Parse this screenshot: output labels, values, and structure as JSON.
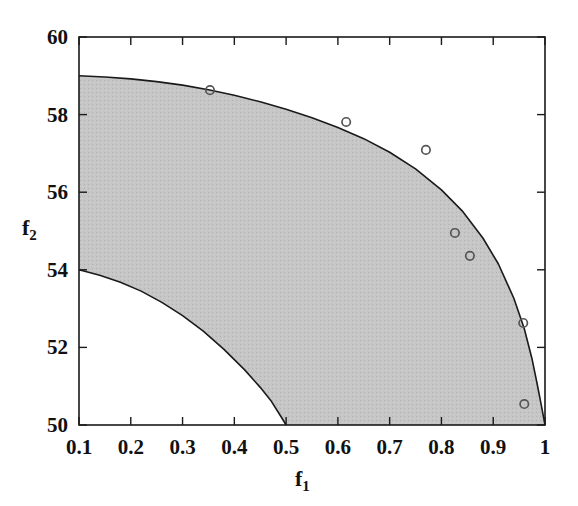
{
  "chart_data": {
    "type": "area",
    "title": "",
    "xlabel": "f₁",
    "ylabel": "f₂",
    "xlim": [
      0.1,
      1.0
    ],
    "ylim": [
      50,
      60
    ],
    "grid": false,
    "legend": "none",
    "xticks": [
      0.1,
      0.2,
      0.3,
      0.4,
      0.5,
      0.6,
      0.7,
      0.8,
      0.9,
      1.0
    ],
    "xticklabels": [
      "0.1",
      "0.2",
      "0.3",
      "0.4",
      "0.5",
      "0.6",
      "0.7",
      "0.8",
      "0.9",
      "1"
    ],
    "yticks": [
      50,
      52,
      54,
      56,
      58,
      60
    ],
    "yticklabels": [
      "50",
      "52",
      "54",
      "56",
      "58",
      "60"
    ],
    "shaded_region": {
      "name": "feasible-region",
      "fill_color": "#c6c6c6",
      "edge_color": "#1a1a1a",
      "upper_boundary": {
        "name": "pareto-front-upper",
        "points": [
          [
            0.1,
            59.0
          ],
          [
            0.15,
            58.97
          ],
          [
            0.2,
            58.92
          ],
          [
            0.25,
            58.85
          ],
          [
            0.3,
            58.76
          ],
          [
            0.35,
            58.64
          ],
          [
            0.4,
            58.5
          ],
          [
            0.45,
            58.33
          ],
          [
            0.5,
            58.14
          ],
          [
            0.55,
            57.92
          ],
          [
            0.6,
            57.67
          ],
          [
            0.65,
            57.38
          ],
          [
            0.7,
            57.03
          ],
          [
            0.75,
            56.6
          ],
          [
            0.8,
            56.06
          ],
          [
            0.84,
            55.52
          ],
          [
            0.88,
            54.82
          ],
          [
            0.91,
            54.15
          ],
          [
            0.94,
            53.26
          ],
          [
            0.96,
            52.48
          ],
          [
            0.975,
            51.7
          ],
          [
            0.985,
            51.05
          ],
          [
            0.993,
            50.5
          ],
          [
            1.0,
            50.0
          ]
        ]
      },
      "lower_boundary": {
        "name": "pareto-front-lower",
        "points": [
          [
            0.1,
            54.0
          ],
          [
            0.14,
            53.86
          ],
          [
            0.18,
            53.68
          ],
          [
            0.22,
            53.45
          ],
          [
            0.26,
            53.16
          ],
          [
            0.3,
            52.82
          ],
          [
            0.34,
            52.42
          ],
          [
            0.38,
            51.95
          ],
          [
            0.42,
            51.42
          ],
          [
            0.45,
            50.97
          ],
          [
            0.47,
            50.64
          ],
          [
            0.49,
            50.22
          ],
          [
            0.5,
            50.0
          ]
        ]
      }
    },
    "series": [
      {
        "name": "solutions",
        "marker": "open-circle",
        "marker_color": "#555555",
        "points": [
          {
            "x": 0.353,
            "y": 58.63
          },
          {
            "x": 0.616,
            "y": 57.81
          },
          {
            "x": 0.77,
            "y": 57.09
          },
          {
            "x": 0.826,
            "y": 54.95
          },
          {
            "x": 0.855,
            "y": 54.36
          },
          {
            "x": 0.958,
            "y": 52.63
          },
          {
            "x": 0.96,
            "y": 50.54
          }
        ]
      }
    ]
  },
  "colors": {
    "axis": "#1a1a1a",
    "region_fill": "#c6c6c6",
    "curve": "#1a1a1a",
    "marker": "#555555",
    "background": "#ffffff"
  }
}
